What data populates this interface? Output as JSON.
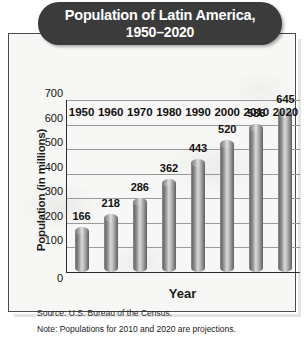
{
  "chart_data": {
    "type": "bar",
    "title": "Population of Latin America, 1950–2020",
    "title_line1": "Population of Latin America,",
    "title_line2": "1950–2020",
    "xlabel": "Year",
    "ylabel": "Population (in millions)",
    "categories": [
      "1950",
      "1960",
      "1970",
      "1980",
      "1990",
      "2000",
      "2010",
      "2020"
    ],
    "values": [
      166,
      218,
      286,
      362,
      443,
      520,
      586,
      645
    ],
    "ylim": [
      0,
      700
    ],
    "ytick_step": 100,
    "yticks": [
      "0",
      "100",
      "200",
      "300",
      "400",
      "500",
      "600",
      "700"
    ],
    "grid": true,
    "legend": false,
    "bar_style": "3d-cylinder-gray",
    "source": "Source: U.S. Bureau of the Census.",
    "note": "Note: Populations for 2010 and 2020 are projections."
  },
  "colors": {
    "title_pill": "#3b3b3b",
    "title_text": "#ffffff",
    "frame_border": "#4a4a4a",
    "plot_background": "#f7f7f5",
    "gridline": "#9a9a9a",
    "axis": "#2b2b2b",
    "bar_light": "#d8d8d8",
    "bar_dark": "#5f5f5f",
    "text": "#1a1a1a"
  }
}
